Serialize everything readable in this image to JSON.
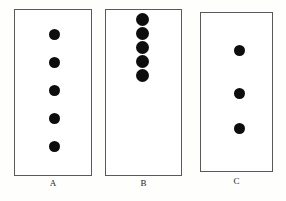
{
  "figure": {
    "kind": "dot-density-comparison-diagram",
    "canvas": {
      "width": 286,
      "height": 201
    },
    "background_color": "#fefefd",
    "border_color": "#59595b",
    "dot_color": "#0d0d0d",
    "label_color": "#1b1b1b",
    "panels": [
      {
        "id": "panel-a",
        "label": "A",
        "dot_count": 5,
        "arrangement": "evenly spaced vertical column spanning full box",
        "box": {
          "x": 14,
          "y": 9,
          "width": 78,
          "height": 167
        },
        "dot_diameter": 11,
        "dot_center_x": 54,
        "dot_centers_y": [
          34,
          62,
          90,
          118,
          146
        ],
        "label_position": {
          "x": 14,
          "y": 178,
          "width": 78
        }
      },
      {
        "id": "panel-b",
        "label": "B",
        "dot_count": 5,
        "arrangement": "tightly clustered vertical column at top of box",
        "box": {
          "x": 105,
          "y": 9,
          "width": 77,
          "height": 167
        },
        "dot_diameter": 13,
        "dot_center_x": 142,
        "dot_centers_y": [
          19,
          33,
          47,
          61,
          75
        ],
        "label_position": {
          "x": 105,
          "y": 178,
          "width": 77
        }
      },
      {
        "id": "panel-c",
        "label": "C",
        "dot_count": 3,
        "arrangement": "evenly spaced vertical column in middle of box",
        "box": {
          "x": 200,
          "y": 12,
          "width": 73,
          "height": 160
        },
        "dot_diameter": 11,
        "dot_center_x": 239,
        "dot_centers_y": [
          50,
          93,
          128
        ],
        "label_position": {
          "x": 200,
          "y": 176,
          "width": 73
        }
      }
    ]
  }
}
